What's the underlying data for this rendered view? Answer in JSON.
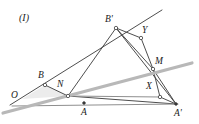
{
  "figure": {
    "caption": "(I)",
    "caption_position": {
      "x": 19,
      "y": 13
    },
    "width": 199,
    "height": 124,
    "background": "#ffffff",
    "stroke_dark": "#3a3a3a",
    "stroke_gray": "#9a9a9a",
    "stroke_light_gray": "#b5b5b5",
    "shade_fill": "#ececec",
    "vertex_fill": "#ffffff",
    "vertex_stroke": "#3a3a3a"
  },
  "points": [
    {
      "id": "O",
      "label": "O",
      "x": 22,
      "y": 99,
      "label_x": 11,
      "label_y": 91,
      "marker": "none"
    },
    {
      "id": "B",
      "label": "B",
      "x": 45,
      "y": 85,
      "label_x": 38,
      "label_y": 71,
      "marker": "hollow"
    },
    {
      "id": "N",
      "label": "N",
      "x": 68,
      "y": 96,
      "label_x": 57,
      "label_y": 80,
      "marker": "hollow"
    },
    {
      "id": "A",
      "label": "A",
      "x": 84,
      "y": 103,
      "label_x": 81,
      "label_y": 108,
      "marker": "solid"
    },
    {
      "id": "Bp",
      "label": "B'",
      "x": 116,
      "y": 28,
      "label_x": 105,
      "label_y": 15,
      "marker": "hollow"
    },
    {
      "id": "Y",
      "label": "Y",
      "x": 141,
      "y": 38,
      "label_x": 142,
      "label_y": 26,
      "marker": "hollow"
    },
    {
      "id": "M",
      "label": "M",
      "x": 153,
      "y": 69,
      "label_x": 155,
      "label_y": 57,
      "marker": "hollow"
    },
    {
      "id": "X",
      "label": "X",
      "x": 160,
      "y": 97,
      "label_x": 146,
      "label_y": 82,
      "marker": "hollow"
    },
    {
      "id": "Ap",
      "label": "A'",
      "x": 176,
      "y": 104,
      "label_x": 174,
      "label_y": 109,
      "marker": "solid"
    }
  ],
  "segments": [
    {
      "name": "ray-O-Bprime-extended",
      "from": [
        10,
        105
      ],
      "to": [
        162,
        10
      ],
      "color": "#3a3a3a",
      "width": 0.9
    },
    {
      "name": "segment-B-N",
      "from": [
        45,
        85
      ],
      "to": [
        68,
        96
      ],
      "color": "#3a3a3a",
      "width": 0.9
    },
    {
      "name": "segment-N-Bprime",
      "from": [
        68,
        96
      ],
      "to": [
        116,
        28
      ],
      "color": "#3a3a3a",
      "width": 0.9
    },
    {
      "name": "segment-Bprime-Y",
      "from": [
        116,
        28
      ],
      "to": [
        141,
        38
      ],
      "color": "#3a3a3a",
      "width": 0.9
    },
    {
      "name": "segment-Y-M",
      "from": [
        141,
        38
      ],
      "to": [
        153,
        69
      ],
      "color": "#3a3a3a",
      "width": 0.9
    },
    {
      "name": "segment-Bprime-M",
      "from": [
        116,
        28
      ],
      "to": [
        153,
        69
      ],
      "color": "#3a3a3a",
      "width": 0.9
    },
    {
      "name": "segment-Bprime-Aprime",
      "from": [
        116,
        28
      ],
      "to": [
        176,
        104
      ],
      "color": "#3a3a3a",
      "width": 0.9
    },
    {
      "name": "segment-M-Aprime",
      "from": [
        153,
        69
      ],
      "to": [
        176,
        104
      ],
      "color": "#3a3a3a",
      "width": 0.9
    },
    {
      "name": "segment-M-X",
      "from": [
        153,
        69
      ],
      "to": [
        160,
        97
      ],
      "color": "#3a3a3a",
      "width": 0.9
    },
    {
      "name": "segment-X-Aprime",
      "from": [
        160,
        97
      ],
      "to": [
        176,
        104
      ],
      "color": "#3a3a3a",
      "width": 0.9
    },
    {
      "name": "segment-N-Aprime",
      "from": [
        68,
        96
      ],
      "to": [
        176,
        104
      ],
      "color": "#3a3a3a",
      "width": 0.9
    },
    {
      "name": "baseline-O-Aprime",
      "from": [
        12,
        106
      ],
      "to": [
        178,
        104
      ],
      "color": "#8f8f8f",
      "width": 1.1
    },
    {
      "name": "gray-line-N-X",
      "from": [
        68,
        96
      ],
      "to": [
        161,
        97
      ],
      "color": "#8f8f8f",
      "width": 1.1
    },
    {
      "name": "gray-ray-O-M-extended",
      "from": [
        3,
        113
      ],
      "to": [
        192,
        63
      ],
      "color": "#b8b8b8",
      "width": 3.2
    }
  ],
  "shaded_regions": [
    {
      "name": "triangle-O-B-N-shade",
      "points": "22,99 45,85 68,96",
      "fill": "#ececec"
    }
  ]
}
